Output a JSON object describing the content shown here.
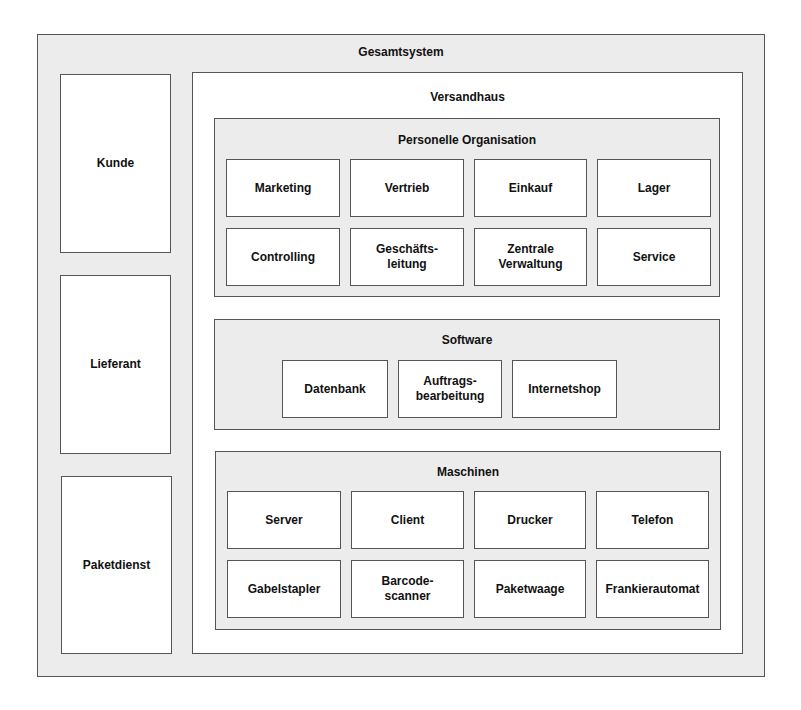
{
  "gesamtsystem": {
    "title": "Gesamtsystem",
    "actors": [
      {
        "label": "Kunde"
      },
      {
        "label": "Lieferant"
      },
      {
        "label": "Paketdienst"
      }
    ]
  },
  "versandhaus": {
    "title": "Versandhaus",
    "personelle_organisation": {
      "title": "Personelle Organisation",
      "items": [
        "Marketing",
        "Vertrieb",
        "Einkauf",
        "Lager",
        "Controlling",
        "Geschäfts-\nleitung",
        "Zentrale\nVerwaltung",
        "Service"
      ]
    },
    "software": {
      "title": "Software",
      "items": [
        "Datenbank",
        "Auftrags-\nbearbeitung",
        "Internetshop"
      ]
    },
    "maschinen": {
      "title": "Maschinen",
      "items": [
        "Server",
        "Client",
        "Drucker",
        "Telefon",
        "Gabelstapler",
        "Barcode-\nscanner",
        "Paketwaage",
        "Frankierautomat"
      ]
    }
  },
  "colors": {
    "container_fill": "#ececec",
    "box_fill": "#ffffff",
    "border": "#555555"
  }
}
